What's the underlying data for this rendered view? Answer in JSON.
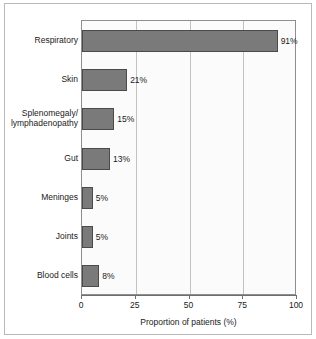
{
  "chart_data": {
    "type": "bar",
    "orientation": "horizontal",
    "title": "",
    "xlabel": "Proportion of patients (%)",
    "ylabel": "",
    "xlim": [
      0,
      100
    ],
    "xticks": [
      "0",
      "25",
      "50",
      "75",
      "100"
    ],
    "xtick_values": [
      0,
      25,
      50,
      75,
      100
    ],
    "grid": true,
    "grid_axis": "x",
    "legend": false,
    "categories": [
      "Respiratory",
      "Skin",
      "Splenomegaly/\nlymphadenopathy",
      "Gut",
      "Meninges",
      "Joints",
      "Blood cells"
    ],
    "values": [
      91,
      21,
      15,
      13,
      5,
      5,
      8
    ],
    "value_labels": [
      "91%",
      "21%",
      "15%",
      "13%",
      "5%",
      "5%",
      "8%"
    ],
    "bar_color": "#7a7a7a",
    "bar_edge_color": "#4a4a4a",
    "plot_background": "#fbfbfb",
    "axis_color": "#6e6e6e"
  }
}
